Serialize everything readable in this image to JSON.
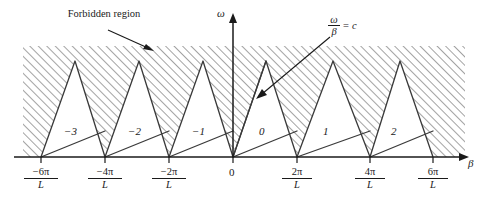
{
  "figure": {
    "type": "brillouin-dispersion-diagram",
    "title_annotation": "Forbidden region",
    "axes": {
      "x_label": "β",
      "y_label": "ω",
      "origin_label": "0"
    },
    "light_line": {
      "numerator": "ω",
      "denominator": "β",
      "equals": "=",
      "value": "c"
    },
    "x_ticks": [
      {
        "num": "−6π",
        "den": "L",
        "x": 41
      },
      {
        "num": "−4π",
        "den": "L",
        "x": 105
      },
      {
        "num": "−2π",
        "den": "L",
        "x": 169
      },
      {
        "num": "0",
        "den": "",
        "x": 233
      },
      {
        "num": "2π",
        "den": "L",
        "x": 297
      },
      {
        "num": "4π",
        "den": "L",
        "x": 370
      },
      {
        "num": "6π",
        "den": "L",
        "x": 433
      }
    ],
    "space_harmonics": [
      {
        "label": "−3",
        "x": 72,
        "y": 133
      },
      {
        "label": "−2",
        "x": 136,
        "y": 133
      },
      {
        "label": "−1",
        "x": 200,
        "y": 133
      },
      {
        "label": "0",
        "x": 262,
        "y": 133
      },
      {
        "label": "1",
        "x": 326,
        "y": 133
      },
      {
        "label": "2",
        "x": 394,
        "y": 133
      }
    ],
    "colors": {
      "ink": "#1a1a1a",
      "hatch": "#8c8c8c",
      "background": "#ffffff"
    }
  }
}
